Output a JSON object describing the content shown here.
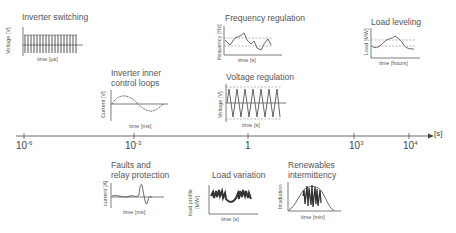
{
  "timeline": {
    "unit": "[s]",
    "ticks": [
      {
        "base": "10",
        "exp": "-6"
      },
      {
        "base": "10",
        "exp": "-3"
      },
      {
        "base": "1",
        "exp": ""
      },
      {
        "base": "10",
        "exp": "3"
      },
      {
        "base": "10",
        "exp": "4"
      }
    ]
  },
  "panels": {
    "inverter_switching": {
      "title": "Inverter switching",
      "ylabel": "Voltage [V]",
      "xlabel": "time [µs]"
    },
    "inverter_inner": {
      "title_line1": "Inverter inner",
      "title_line2": "control loops",
      "ylabel": "Current [V]",
      "xlabel": "time [ms]"
    },
    "frequency_regulation": {
      "title": "Frequency regulation",
      "ylabel": "frequency [Hz]",
      "xlabel": "time [s]"
    },
    "voltage_regulation": {
      "title": "Voltage regulation",
      "ylabel": "Voltage [V]",
      "xlabel": "time [s]"
    },
    "load_leveling": {
      "title": "Load leveling",
      "ylabel": "Load [MW]",
      "xlabel": "time [hours]"
    },
    "faults": {
      "title_line1": "Faults and",
      "title_line2": "relay protection",
      "ylabel": "current [A]",
      "xlabel": "time [ms]"
    },
    "load_variation": {
      "title": "Load variation",
      "ylabel_line1": "load profile",
      "ylabel_line2": "[MW]",
      "xlabel": "time [s]"
    },
    "renewables": {
      "title_line1": "Renewables",
      "title_line2": "intermittency",
      "ylabel": "Irradiation",
      "xlabel": "time [min]"
    }
  },
  "colors": {
    "line": "#555555",
    "dashed": "#888888",
    "axis": "#444444"
  }
}
